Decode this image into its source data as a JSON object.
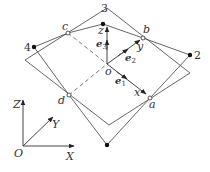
{
  "diagram": {
    "type": "geometric-rotation-diagram",
    "colors": {
      "line": "#555555",
      "text": "#333333",
      "background": "#ffffff"
    },
    "nodes": {
      "3": {
        "label": "3",
        "x": 103,
        "y": 24,
        "marker": "filled"
      },
      "4": {
        "label": "4",
        "x": 34,
        "y": 47,
        "marker": "filled"
      },
      "2": {
        "label": "2",
        "x": 190,
        "y": 55,
        "marker": "filled"
      },
      "bottom": {
        "label": "",
        "x": 107,
        "y": 145,
        "marker": "filled"
      },
      "a": {
        "label": "a",
        "x": 150,
        "y": 98,
        "marker": "open"
      },
      "b": {
        "label": "b",
        "x": 143,
        "y": 38,
        "marker": "open"
      },
      "c": {
        "label": "c",
        "x": 68,
        "y": 33,
        "marker": "open"
      },
      "d": {
        "label": "d",
        "x": 69,
        "y": 95,
        "marker": "open"
      },
      "o": {
        "label": "o",
        "x": 107,
        "y": 64,
        "marker": "none"
      }
    },
    "local_axes": {
      "x": {
        "label": "x"
      },
      "y": {
        "label": "y"
      },
      "z": {
        "label": "z"
      },
      "e1": {
        "label": "e",
        "sub": "1"
      },
      "e2": {
        "label": "e",
        "sub": "2"
      },
      "e3": {
        "label": "e",
        "sub": "3"
      }
    },
    "global_axes": {
      "origin": "O",
      "X": "X",
      "Y": "Y",
      "Z": "Z"
    }
  }
}
